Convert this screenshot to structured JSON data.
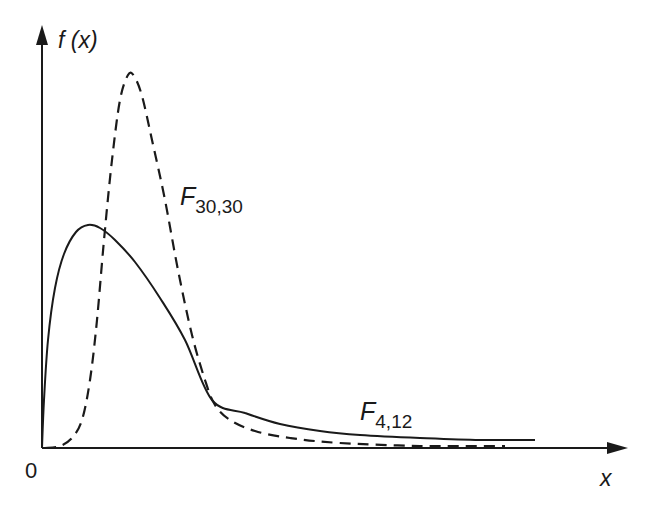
{
  "chart_data": {
    "type": "line",
    "title": "",
    "xlabel": "x",
    "ylabel": "f (x)",
    "origin_label": "0",
    "grid": false,
    "legend": "inline labels",
    "axis_ticks": "none",
    "series": [
      {
        "name": "F4,12",
        "label_main": "F",
        "label_sub": "4,12",
        "style": "solid",
        "color": "#1a1a1a",
        "description": "F distribution with 4 and 12 degrees of freedom; right-skewed, lower broad peak near the origin, long tail",
        "points_px": [
          [
            42,
            448
          ],
          [
            44,
            400
          ],
          [
            48,
            340
          ],
          [
            55,
            288
          ],
          [
            64,
            254
          ],
          [
            76,
            232
          ],
          [
            88,
            225
          ],
          [
            100,
            228
          ],
          [
            115,
            240
          ],
          [
            135,
            262
          ],
          [
            160,
            298
          ],
          [
            185,
            340
          ],
          [
            212,
            400
          ],
          [
            245,
            413
          ],
          [
            280,
            424
          ],
          [
            320,
            431
          ],
          [
            360,
            435
          ],
          [
            420,
            438
          ],
          [
            480,
            440
          ],
          [
            535,
            440
          ]
        ]
      },
      {
        "name": "F30,30",
        "label_main": "F",
        "label_sub": "30,30",
        "style": "dashed",
        "color": "#1a1a1a",
        "description": "F distribution with 30 and 30 degrees of freedom; tall narrow peak, concentrated around 1",
        "points_px": [
          [
            45,
            448
          ],
          [
            60,
            446
          ],
          [
            72,
            438
          ],
          [
            82,
            420
          ],
          [
            90,
            380
          ],
          [
            97,
            320
          ],
          [
            104,
            240
          ],
          [
            112,
            160
          ],
          [
            120,
            100
          ],
          [
            128,
            75
          ],
          [
            134,
            76
          ],
          [
            142,
            96
          ],
          [
            152,
            140
          ],
          [
            165,
            200
          ],
          [
            178,
            270
          ],
          [
            192,
            335
          ],
          [
            205,
            380
          ],
          [
            215,
            405
          ],
          [
            230,
            420
          ],
          [
            255,
            431
          ],
          [
            290,
            438
          ],
          [
            340,
            443
          ],
          [
            420,
            446
          ],
          [
            505,
            446
          ]
        ]
      }
    ],
    "annotations": [
      {
        "text": "F30,30",
        "near": "dashed curve, right of its descending side"
      },
      {
        "text": "F4,12",
        "near": "solid curve tail"
      }
    ]
  },
  "labels": {
    "y_axis": "f (x)",
    "x_axis": "x",
    "origin": "0",
    "f3030_main": "F",
    "f3030_sub": "30,30",
    "f412_main": "F",
    "f412_sub": "4,12"
  },
  "colors": {
    "line": "#1a1a1a",
    "background": "#ffffff"
  }
}
